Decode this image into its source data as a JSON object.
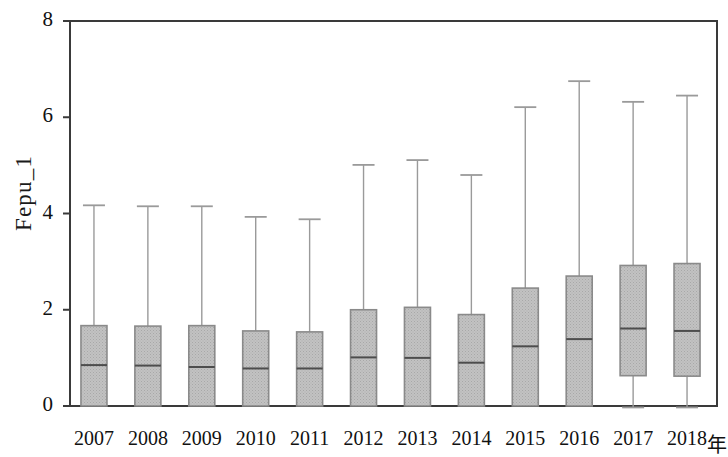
{
  "chart_data": {
    "type": "box",
    "title": "",
    "xlabel": "年",
    "ylabel": "Fepu_1",
    "ylim": [
      0,
      8
    ],
    "y_ticks": [
      0,
      2,
      4,
      6,
      8
    ],
    "y_tick_labels": [
      "0",
      "2",
      "4",
      "6",
      "8"
    ],
    "grid": false,
    "legend": "none",
    "categories": [
      "2007",
      "2008",
      "2009",
      "2010",
      "2011",
      "2012",
      "2013",
      "2014",
      "2015",
      "2016",
      "2017",
      "2018"
    ],
    "boxes": [
      {
        "category": "2007",
        "whisker_low": 0.0,
        "q1": 0.0,
        "median": 0.85,
        "q3": 1.67,
        "whisker_high": 4.17
      },
      {
        "category": "2008",
        "whisker_low": 0.0,
        "q1": 0.0,
        "median": 0.84,
        "q3": 1.66,
        "whisker_high": 4.15
      },
      {
        "category": "2009",
        "whisker_low": 0.0,
        "q1": 0.0,
        "median": 0.81,
        "q3": 1.67,
        "whisker_high": 4.15
      },
      {
        "category": "2010",
        "whisker_low": 0.0,
        "q1": 0.0,
        "median": 0.78,
        "q3": 1.56,
        "whisker_high": 3.93
      },
      {
        "category": "2011",
        "whisker_low": 0.0,
        "q1": 0.0,
        "median": 0.78,
        "q3": 1.54,
        "whisker_high": 3.88
      },
      {
        "category": "2012",
        "whisker_low": 0.0,
        "q1": 0.0,
        "median": 1.01,
        "q3": 2.0,
        "whisker_high": 5.01
      },
      {
        "category": "2013",
        "whisker_low": 0.0,
        "q1": 0.0,
        "median": 1.0,
        "q3": 2.05,
        "whisker_high": 5.11
      },
      {
        "category": "2014",
        "whisker_low": 0.0,
        "q1": 0.0,
        "median": 0.9,
        "q3": 1.9,
        "whisker_high": 4.8
      },
      {
        "category": "2015",
        "whisker_low": 0.0,
        "q1": 0.0,
        "median": 1.24,
        "q3": 2.45,
        "whisker_high": 6.21
      },
      {
        "category": "2016",
        "whisker_low": 0.0,
        "q1": 0.0,
        "median": 1.39,
        "q3": 2.7,
        "whisker_high": 6.75
      },
      {
        "category": "2017",
        "whisker_low": -0.03,
        "q1": 0.63,
        "median": 1.61,
        "q3": 2.92,
        "whisker_high": 6.32
      },
      {
        "category": "2018",
        "whisker_low": -0.03,
        "q1": 0.62,
        "median": 1.56,
        "q3": 2.96,
        "whisker_high": 6.45
      }
    ],
    "colors": {
      "box_fill": "#b9b9b9",
      "box_edge": "#8a8a8a",
      "median_line": "#4d4d4d",
      "whisker": "#9a9a9a",
      "axis": "#3a3a3a",
      "text": "#111111"
    }
  }
}
